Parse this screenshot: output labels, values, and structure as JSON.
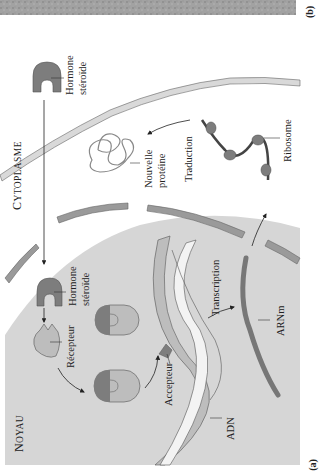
{
  "figure": {
    "orientation": "rotated-90-ccw",
    "panels": [
      {
        "id": "a",
        "label": "(a)"
      },
      {
        "id": "b",
        "label": "(b)"
      }
    ],
    "regions": {
      "nucleus": {
        "label_first": "N",
        "label_rest": "OYAU"
      },
      "cytoplasm": {
        "label_first": "C",
        "label_rest": "YTOPLASME"
      }
    },
    "labels": {
      "hormone_outside_1": "Hormone",
      "hormone_outside_2": "stéroïde",
      "hormone_inside_1": "Hormone",
      "hormone_inside_2": "stéroïde",
      "receptor": "Récepteur",
      "acceptor": "Accepteur",
      "dna": "ADN",
      "transcription": "Transcription",
      "mrna": "ARNm",
      "translation": "Traduction",
      "new_protein_1": "Nouvelle",
      "new_protein_2": "protéine",
      "ribosome": "Ribosome"
    },
    "colors": {
      "nucleus_fill": "#d6d6d6",
      "cytoplasm_fill": "#ffffff",
      "membrane_fill": "#d9d9d9",
      "hormone_fill": "#7d7d7d",
      "receptor_fill": "#bdbdbd",
      "envelope_fill": "#9a9a9a",
      "photo_strip": "#9c9c9c",
      "text": "#222222"
    }
  }
}
